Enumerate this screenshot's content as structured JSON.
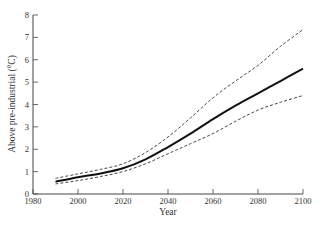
{
  "chart_data": {
    "type": "line",
    "title": "",
    "xlabel": "Year",
    "ylabel": "Above pre-industrial (°C)",
    "xlim": [
      1980,
      2100
    ],
    "ylim": [
      0,
      8
    ],
    "x_ticks": [
      1980,
      2000,
      2020,
      2040,
      2060,
      2080,
      2100
    ],
    "y_ticks": [
      0,
      1,
      2,
      3,
      4,
      5,
      6,
      7,
      8
    ],
    "grid": false,
    "legend": null,
    "x": [
      1990,
      2000,
      2010,
      2020,
      2030,
      2040,
      2050,
      2060,
      2070,
      2080,
      2090,
      2100
    ],
    "series": [
      {
        "name": "central estimate",
        "style": "solid",
        "color": "#111111",
        "values": [
          0.55,
          0.75,
          0.92,
          1.15,
          1.55,
          2.1,
          2.7,
          3.35,
          3.95,
          4.5,
          5.05,
          5.6
        ]
      },
      {
        "name": "upper bound",
        "style": "dashed",
        "color": "#333333",
        "values": [
          0.7,
          0.9,
          1.1,
          1.35,
          1.85,
          2.55,
          3.4,
          4.3,
          5.05,
          5.75,
          6.6,
          7.35
        ]
      },
      {
        "name": "lower bound",
        "style": "dashed",
        "color": "#333333",
        "values": [
          0.45,
          0.6,
          0.78,
          1.0,
          1.35,
          1.8,
          2.25,
          2.7,
          3.25,
          3.75,
          4.1,
          4.4
        ]
      }
    ]
  }
}
